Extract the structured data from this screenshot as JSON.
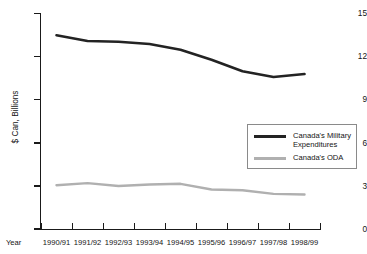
{
  "chart_data": {
    "type": "line",
    "title": "",
    "xlabel": "Year",
    "ylabel": "$ Can, Billions",
    "ylim": [
      0,
      15
    ],
    "yticks": [
      0,
      3,
      6,
      9,
      12,
      15
    ],
    "ytick_labels": [
      "0",
      "3",
      "6",
      "9",
      "12",
      "15"
    ],
    "grid": false,
    "legend_position": "center-right",
    "categories": [
      "1990/91",
      "1991/92",
      "1992/93",
      "1993/94",
      "1994/95",
      "1995/96",
      "1996/97",
      "1997/98",
      "1998/99"
    ],
    "series": [
      {
        "name": "Canada's Military Expenditures",
        "color": "#232323",
        "values": [
          13.5,
          13.1,
          13.05,
          12.9,
          12.5,
          11.8,
          11.0,
          10.6,
          10.8
        ]
      },
      {
        "name": "Canada's ODA",
        "color": "#b0b0b0",
        "values": [
          3.05,
          3.2,
          3.0,
          3.1,
          3.15,
          2.75,
          2.7,
          2.45,
          2.4
        ]
      }
    ]
  },
  "axis": {
    "year_caption": "Year",
    "y_title": "$ Can, Billions"
  },
  "legend": {
    "items": [
      {
        "label": "Canada's Military\nExpenditures",
        "swatch": "military"
      },
      {
        "label": "Canada's ODA",
        "swatch": "oda"
      }
    ]
  }
}
